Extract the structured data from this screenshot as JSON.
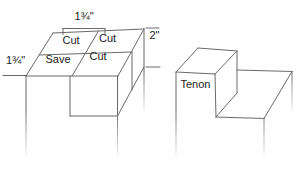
{
  "figure_left": {
    "name": "tenon layout on stock",
    "dimensions": {
      "top_width": "1¾\"",
      "left_depth": "1¾\"",
      "right_height": "2\""
    },
    "quadrants": {
      "back_left": "Cut",
      "back_right": "Cut",
      "front_left": "Save",
      "front_right": "Cut"
    }
  },
  "figure_right": {
    "name": "finished tenon",
    "label": "Tenon"
  },
  "colors": {
    "line": "#6a6a6a",
    "text": "#222222",
    "background": "#ffffff"
  }
}
